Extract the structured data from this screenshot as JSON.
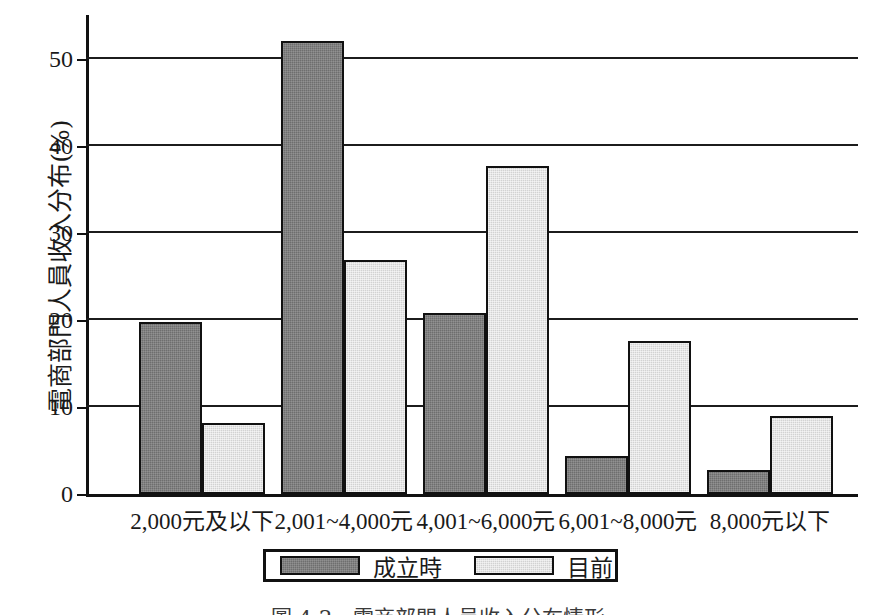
{
  "chart_data": {
    "type": "bar",
    "title": "",
    "xlabel": "",
    "ylabel": "電商部門人員收入分布(%)",
    "ylim": [
      0,
      55
    ],
    "yticks": [
      0,
      10,
      20,
      30,
      40,
      50
    ],
    "ytick_labels": [
      "0",
      "10",
      "20",
      "30",
      "40",
      "50"
    ],
    "grid": "horizontal",
    "legend_position": "bottom-center",
    "categories": [
      "2,000元及以下",
      "2,001~4,000元",
      "4,001~6,000元",
      "6,001~8,000元",
      "8,000元以下"
    ],
    "series": [
      {
        "name": "成立時",
        "color": "#6e6e6e",
        "values": [
          19.7,
          52.0,
          20.8,
          4.4,
          2.8
        ]
      },
      {
        "name": "目前",
        "color": "#d2d2d2",
        "values": [
          8.1,
          26.9,
          37.7,
          17.6,
          9.0
        ]
      }
    ]
  },
  "caption": {
    "text": "圖 4-2　電商部門人員收入分布情形"
  }
}
